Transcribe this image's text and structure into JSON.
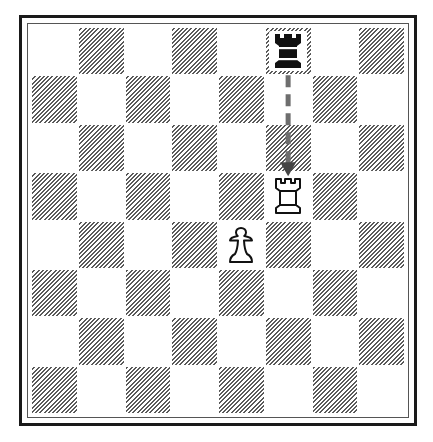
{
  "diagram": {
    "type": "chess-position",
    "board_size": 8,
    "orientation": "white-bottom",
    "colors": {
      "frame": "#1a1a1a",
      "hatch": "#5a5a5a",
      "light_square": "#ffffff",
      "arrow": "#6e6e6e"
    },
    "pieces": [
      {
        "square": "f8",
        "color": "black",
        "type": "rook",
        "symbol": "♜",
        "icon": "black-rook-icon"
      },
      {
        "square": "f5",
        "color": "white",
        "type": "rook",
        "symbol": "♖",
        "icon": "white-rook-icon"
      },
      {
        "square": "e4",
        "color": "white",
        "type": "pawn",
        "symbol": "♙",
        "icon": "white-pawn-icon"
      }
    ],
    "arrows": [
      {
        "from": "f8",
        "to": "f5",
        "style": "dashed"
      }
    ]
  }
}
